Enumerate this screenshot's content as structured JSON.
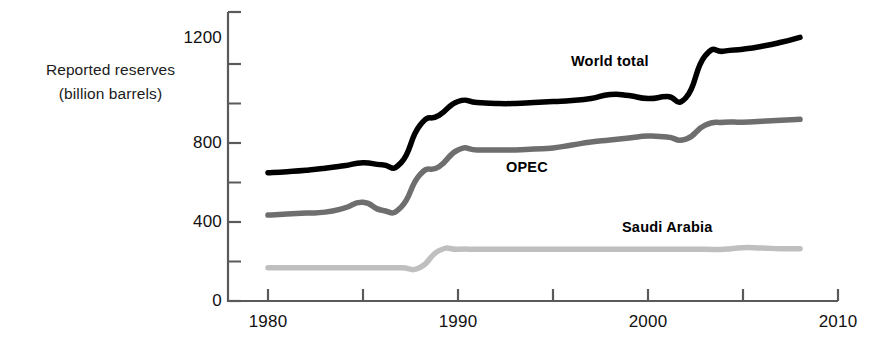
{
  "chart_data": {
    "type": "line",
    "title": "",
    "xlabel": "",
    "ylabel": "Reported reserves (billion barrels)",
    "ylabel_line1": "Reported reserves",
    "ylabel_line2": "(billion barrels)",
    "xlim": [
      1980,
      2010
    ],
    "ylim": [
      0,
      1300
    ],
    "grid": false,
    "legend_position": "inline-annotations",
    "y_ticks_major": [
      0,
      400,
      800,
      1200
    ],
    "y_ticks_minor": [
      200,
      600,
      1000
    ],
    "y_tick_labels": [
      "0",
      "400",
      "800",
      "1200"
    ],
    "x_ticks_major": [
      1980,
      1990,
      2000,
      2010
    ],
    "x_ticks_minor": [
      1985,
      1995,
      2005
    ],
    "x_tick_labels": [
      "1980",
      "1990",
      "2000",
      "2010"
    ],
    "annotations": [
      {
        "text": "World total",
        "series": "World total",
        "x": 1996.5,
        "y": 1120
      },
      {
        "text": "OPEC",
        "series": "OPEC",
        "x": 1994.5,
        "y": 640
      },
      {
        "text": "Saudi Arabia",
        "series": "Saudi Arabia",
        "x": 1999.0,
        "y": 400
      }
    ],
    "series": [
      {
        "name": "World total",
        "color": "#000000",
        "width": 5.5,
        "x": [
          1980,
          1981,
          1982,
          1983,
          1984,
          1985,
          1986,
          1987,
          1988,
          1989,
          1990,
          1991,
          1992,
          1993,
          1994,
          1995,
          1996,
          1997,
          1998,
          1999,
          2000,
          2001,
          2002,
          2003,
          2004,
          2005,
          2006,
          2007,
          2008
        ],
        "values": [
          650,
          655,
          662,
          672,
          685,
          700,
          690,
          700,
          890,
          940,
          1010,
          1005,
          1000,
          1000,
          1005,
          1010,
          1015,
          1025,
          1045,
          1040,
          1025,
          1035,
          1030,
          1240,
          1265,
          1275,
          1290,
          1310,
          1335
        ]
      },
      {
        "name": "OPEC",
        "color": "#6e6e6e",
        "width": 5.5,
        "x": [
          1980,
          1981,
          1982,
          1983,
          1984,
          1985,
          1986,
          1987,
          1988,
          1989,
          1990,
          1991,
          1992,
          1993,
          1994,
          1995,
          1996,
          1997,
          1998,
          1999,
          2000,
          2001,
          2002,
          2003,
          2004,
          2005,
          2006,
          2007,
          2008
        ],
        "values": [
          435,
          440,
          445,
          450,
          470,
          500,
          460,
          475,
          640,
          680,
          765,
          765,
          765,
          765,
          770,
          775,
          790,
          805,
          815,
          825,
          835,
          830,
          820,
          890,
          905,
          905,
          910,
          915,
          920
        ]
      },
      {
        "name": "Saudi Arabia",
        "color": "#bfbfbf",
        "width": 5.5,
        "x": [
          1980,
          1981,
          1982,
          1983,
          1984,
          1985,
          1986,
          1987,
          1988,
          1989,
          1990,
          1991,
          1992,
          1993,
          1994,
          1995,
          1996,
          1997,
          1998,
          1999,
          2000,
          2001,
          2002,
          2003,
          2004,
          2005,
          2006,
          2007,
          2008
        ],
        "values": [
          168,
          168,
          168,
          168,
          168,
          168,
          168,
          168,
          170,
          255,
          262,
          262,
          262,
          262,
          262,
          262,
          262,
          262,
          262,
          262,
          262,
          262,
          262,
          262,
          262,
          270,
          268,
          265,
          265
        ]
      }
    ]
  },
  "axis": {
    "line_color": "#5a5a5a",
    "label": "Reported reserves (billion barrels)"
  }
}
